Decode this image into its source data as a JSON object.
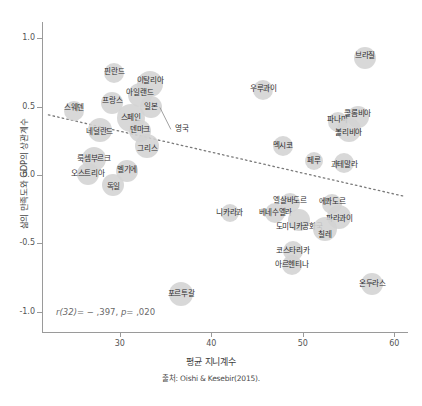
{
  "chart_data": {
    "type": "scatter",
    "title": "",
    "xlabel": "평균 지니계수",
    "ylabel": "삶의 만족도와 GDP의 상관계수",
    "source": "출처: Oishi & Kesebir(2015).",
    "annotation": "r(32)= − ,397, p= ,020",
    "annotation_parts": {
      "r_stat": "r(32)",
      "r_value": "= − ,397,",
      "p_stat": "p",
      "p_value": "= ,020"
    },
    "xlim": [
      21.5,
      61.5
    ],
    "ylim": [
      -1.15,
      1.12
    ],
    "xticks": [
      30,
      40,
      50,
      60
    ],
    "yticks": [
      "1.0",
      "0.5",
      "0.0",
      "-0.5",
      "-1.0"
    ],
    "ytick_values": [
      1.0,
      0.5,
      0.0,
      -0.5,
      -1.0
    ],
    "grid": false,
    "legend": "none",
    "marker_color": "#d3d3d3",
    "trendline": {
      "style": "dotted",
      "color": "#7a7a7a",
      "x_start": 22.2,
      "y_start": 0.44,
      "x_end": 61.0,
      "y_end": -0.155
    },
    "points": [
      {
        "label": "브라질",
        "x": 56.8,
        "y": 0.855,
        "r": 11,
        "label_dx": 0,
        "label_dy": -2
      },
      {
        "label": "핀란드",
        "x": 29.4,
        "y": 0.745,
        "r": 10,
        "label_dx": 0,
        "label_dy": -1
      },
      {
        "label": "이탈리아",
        "x": 33.3,
        "y": 0.665,
        "r": 13,
        "label_dx": 0,
        "label_dy": -3
      },
      {
        "label": "우루과이",
        "x": 45.7,
        "y": 0.625,
        "r": 10,
        "label_dx": 0,
        "label_dy": -1
      },
      {
        "label": "아일랜드",
        "x": 32.2,
        "y": 0.585,
        "r": 12,
        "label_dx": 0,
        "label_dy": -2
      },
      {
        "label": "프랑스",
        "x": 29.2,
        "y": 0.525,
        "r": 11,
        "label_dx": 0,
        "label_dy": -2
      },
      {
        "label": "일본",
        "x": 33.4,
        "y": 0.495,
        "r": 11,
        "label_dx": 0,
        "label_dy": 0
      },
      {
        "label": "스웨덴",
        "x": 25.0,
        "y": 0.47,
        "r": 10,
        "label_dx": 0,
        "label_dy": -3
      },
      {
        "label": "콜롬비아",
        "x": 56.0,
        "y": 0.425,
        "r": 11,
        "label_dx": 0,
        "label_dy": -3
      },
      {
        "label": "스페인",
        "x": 31.2,
        "y": 0.415,
        "r": 14,
        "label_dx": 0,
        "label_dy": 0
      },
      {
        "label": "파나마",
        "x": 53.8,
        "y": 0.39,
        "r": 10,
        "label_dx": 0,
        "label_dy": -2
      },
      {
        "label": "영국",
        "x": 34.6,
        "y": 0.48,
        "r": 0,
        "label_dx": 0,
        "label_dy": 0
      },
      {
        "label": "덴마크",
        "x": 32.2,
        "y": 0.325,
        "r": 11,
        "label_dx": 0,
        "label_dy": -1
      },
      {
        "label": "볼리비아",
        "x": 55.0,
        "y": 0.33,
        "r": 12,
        "label_dx": 0,
        "label_dy": 3
      },
      {
        "label": "네덜란드",
        "x": 27.8,
        "y": 0.33,
        "r": 12,
        "label_dx": 0,
        "label_dy": 2
      },
      {
        "label": "그리스",
        "x": 33.0,
        "y": 0.215,
        "r": 12,
        "label_dx": 0,
        "label_dy": 3
      },
      {
        "label": "멕시코",
        "x": 47.8,
        "y": 0.215,
        "r": 10,
        "label_dx": 0,
        "label_dy": 0
      },
      {
        "label": "룩셈부르크",
        "x": 27.2,
        "y": 0.12,
        "r": 12,
        "label_dx": 0,
        "label_dy": 0
      },
      {
        "label": "페루",
        "x": 51.2,
        "y": 0.1,
        "r": 9,
        "label_dx": 0,
        "label_dy": 0
      },
      {
        "label": "과테말라",
        "x": 54.5,
        "y": 0.09,
        "r": 10,
        "label_dx": 0,
        "label_dy": 2
      },
      {
        "label": "오스트리아",
        "x": 26.5,
        "y": 0.01,
        "r": 11,
        "label_dx": 0,
        "label_dy": 0
      },
      {
        "label": "벨기에",
        "x": 30.8,
        "y": 0.03,
        "r": 11,
        "label_dx": 0,
        "label_dy": -1
      },
      {
        "label": "독일",
        "x": 29.3,
        "y": -0.07,
        "r": 11,
        "label_dx": 0,
        "label_dy": 2
      },
      {
        "label": "엘살바도르",
        "x": 48.6,
        "y": -0.205,
        "r": 10,
        "label_dx": 0,
        "label_dy": -2
      },
      {
        "label": "에콰도르",
        "x": 53.2,
        "y": -0.215,
        "r": 10,
        "label_dx": 0,
        "label_dy": -2
      },
      {
        "label": "니카라과",
        "x": 42.0,
        "y": -0.28,
        "r": 9,
        "label_dx": 0,
        "label_dy": 0
      },
      {
        "label": "베네수엘라",
        "x": 47.0,
        "y": -0.275,
        "r": 10,
        "label_dx": 0,
        "label_dy": 0
      },
      {
        "label": "파라과이",
        "x": 54.0,
        "y": -0.31,
        "r": 12,
        "label_dx": 0,
        "label_dy": 2
      },
      {
        "label": "도미니카공화국",
        "x": 49.6,
        "y": -0.33,
        "r": 11,
        "label_dx": 0,
        "label_dy": 7
      },
      {
        "label": "칠레",
        "x": 52.4,
        "y": -0.395,
        "r": 12,
        "label_dx": 0,
        "label_dy": 6
      },
      {
        "label": "코스타리카",
        "x": 48.9,
        "y": -0.555,
        "r": 10,
        "label_dx": 0,
        "label_dy": 0
      },
      {
        "label": "아르헨티나",
        "x": 48.8,
        "y": -0.66,
        "r": 10,
        "label_dx": 0,
        "label_dy": 0
      },
      {
        "label": "온두라스",
        "x": 57.6,
        "y": -0.8,
        "r": 11,
        "label_dx": 0,
        "label_dy": 0
      },
      {
        "label": "포르투갈",
        "x": 36.7,
        "y": -0.87,
        "r": 12,
        "label_dx": 0,
        "label_dy": 0
      }
    ]
  }
}
